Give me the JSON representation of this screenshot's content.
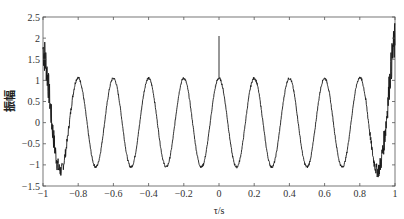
{
  "chart_data": {
    "type": "line",
    "title": "",
    "xlabel": "τ/s",
    "ylabel": "振幅",
    "xlim": [
      -1,
      1
    ],
    "ylim": [
      -1.5,
      2.5
    ],
    "xticks": [
      -1,
      -0.8,
      -0.6,
      -0.4,
      -0.2,
      0,
      0.2,
      0.4,
      0.6,
      0.8,
      1
    ],
    "xtick_labels": [
      "−1",
      "−0.8",
      "−0.6",
      "−0.4",
      "−0.2",
      "0",
      "0.2",
      "0.4",
      "0.6",
      "0.8",
      "1"
    ],
    "yticks": [
      -1.5,
      -1,
      -0.5,
      0,
      0.5,
      1,
      1.5,
      2,
      2.5
    ],
    "ytick_labels": [
      "−1.5",
      "−1",
      "−0.5",
      "0",
      "0.5",
      "1",
      "1.5",
      "2",
      "2.5"
    ],
    "grid": false,
    "legend": null,
    "series": [
      {
        "name": "autocorrelation",
        "description": "cosine-like oscillation, period 0.2 s, amplitude ~1.05, noisy near edges, spike at τ=0",
        "period": 0.2,
        "amplitude": 1.05,
        "peaks_x": [
          -0.8,
          -0.6,
          -0.4,
          -0.2,
          0,
          0.2,
          0.4,
          0.6,
          0.8
        ],
        "peak_values": [
          1.1,
          1.05,
          1.05,
          1.05,
          1.05,
          1.05,
          1.05,
          1.05,
          1.1
        ],
        "troughs_x": [
          -0.9,
          -0.7,
          -0.5,
          -0.3,
          -0.1,
          0.1,
          0.3,
          0.5,
          0.7,
          0.9
        ],
        "trough_values": [
          -1.35,
          -1.05,
          -1.0,
          -1.0,
          -1.0,
          -1.0,
          -1.0,
          -1.0,
          -1.05,
          -1.35
        ],
        "spike": {
          "x": 0,
          "y": 2.05
        },
        "edge_values": {
          "x_-1": 0.1,
          "x_1": 0.3
        }
      }
    ],
    "color": "#1a1a1a"
  },
  "labels": {
    "x_axis_title": "τ/s",
    "y_axis_title": "振幅"
  }
}
